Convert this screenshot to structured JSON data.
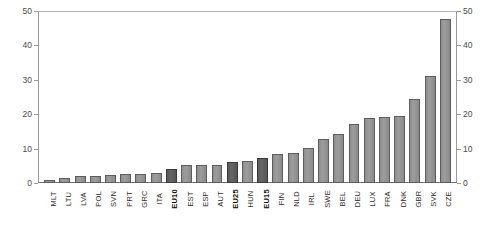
{
  "chart_data": {
    "type": "bar",
    "title": "",
    "subtitle": "",
    "xlabel": "",
    "ylabel": "",
    "ylim": [
      0,
      50
    ],
    "yticks": [
      0,
      10,
      20,
      30,
      40,
      50
    ],
    "dual_y_axis": true,
    "grid": false,
    "legend": "none",
    "series_name": "value",
    "colors": {
      "bar": "#939393",
      "bar_border": "#5d5d5d",
      "highlight_bar": "#5e5e5e",
      "highlight_bar_border": "#3a3a3a",
      "axis": "#9a9a9a",
      "tick_text": "#4a4a4a",
      "label_text": "#2b2b2b",
      "background": "#ffffff"
    },
    "categories": [
      "MLT",
      "LTU",
      "LVA",
      "POL",
      "SVN",
      "PRT",
      "GRC",
      "ITA",
      "EU10",
      "EST",
      "ESP",
      "AUT",
      "EU25",
      "HUN",
      "EU15",
      "FIN",
      "NLD",
      "IRL",
      "SWE",
      "BEL",
      "DEU",
      "LUX",
      "FRA",
      "DNK",
      "GBR",
      "SVK",
      "CZE"
    ],
    "values": [
      1.0,
      1.6,
      2.1,
      2.0,
      2.4,
      2.5,
      2.5,
      2.9,
      4.2,
      5.1,
      5.1,
      5.3,
      6.0,
      6.3,
      7.3,
      8.4,
      8.8,
      10.3,
      12.9,
      14.2,
      17.3,
      18.8,
      19.2,
      19.6,
      24.4,
      31.1,
      47.8
    ],
    "highlighted": [
      "EU10",
      "EU25",
      "EU15"
    ],
    "bold_labels": [
      "EU10",
      "EU25",
      "EU15"
    ],
    "sorted": "ascending"
  }
}
